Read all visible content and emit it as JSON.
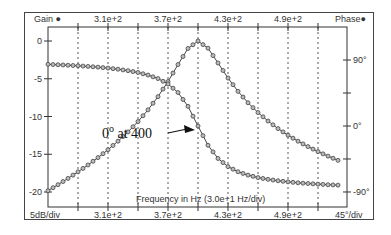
{
  "chart_data": {
    "type": "line",
    "title": "",
    "xlabel": "Frequency in Hz (3.0e+1 Hz/div)",
    "ylabel_left": "Gain",
    "ylabel_right": "Phase",
    "left_scale_label": "5dB/div",
    "right_scale_label": "45°/div",
    "xlim": [
      250,
      549
    ],
    "ylim_left": [
      -22,
      2
    ],
    "ylim_right": [
      -112,
      112
    ],
    "grid": "vertical dashed",
    "x_tick_labels": [
      "3.1e+2",
      "3.7e+2",
      "4.3e+2",
      "4.9e+2"
    ],
    "x_tick_values": [
      310,
      370,
      430,
      490
    ],
    "left_tick_labels": [
      "0",
      "-5",
      "-10",
      "-15",
      "-20"
    ],
    "left_tick_values": [
      0,
      -5,
      -10,
      -15,
      -20
    ],
    "right_tick_labels": [
      "90°",
      "0°",
      "-90°"
    ],
    "right_tick_values": [
      90,
      0,
      -90
    ],
    "annotation": {
      "text": "0° at 400",
      "base": "0",
      "sup": "o",
      "rest": " at 400",
      "x": 400,
      "phase": 0
    },
    "x": [
      250,
      260,
      270,
      280,
      290,
      300,
      310,
      320,
      330,
      340,
      350,
      360,
      370,
      380,
      390,
      400,
      410,
      420,
      430,
      440,
      450,
      460,
      470,
      480,
      490,
      500,
      510,
      520,
      530,
      540
    ],
    "series": [
      {
        "name": "Gain",
        "axis": "left",
        "unit": "dB",
        "values": [
          -19.83,
          -19.03,
          -18.2,
          -17.33,
          -16.42,
          -15.44,
          -14.4,
          -13.27,
          -12.04,
          -10.67,
          -9.12,
          -7.37,
          -5.37,
          -3.12,
          -0.99,
          0,
          -0.95,
          -2.91,
          -4.91,
          -6.67,
          -8.18,
          -9.48,
          -10.6,
          -11.6,
          -12.48,
          -13.27,
          -13.99,
          -14.65,
          -15.25,
          -15.81
        ]
      },
      {
        "name": "Phase",
        "axis": "right",
        "unit": "deg",
        "values": [
          84.1,
          83.6,
          82.9,
          82.2,
          81.3,
          80.3,
          79.0,
          77.5,
          75.5,
          73.0,
          69.5,
          64.7,
          57.4,
          45.7,
          26.8,
          0,
          -26.3,
          -44.3,
          -55.4,
          -62.4,
          -67.0,
          -70.4,
          -72.8,
          -74.7,
          -76.2,
          -77.5,
          -78.5,
          -79.3,
          -80.1,
          -80.7
        ]
      }
    ]
  },
  "labels": {
    "gain": "Gain",
    "phase": "Phase",
    "left_scale": "5dB/div",
    "right_scale": "45°/div",
    "xlabel": "Frequency in Hz (3.0e+1 Hz/div)"
  }
}
